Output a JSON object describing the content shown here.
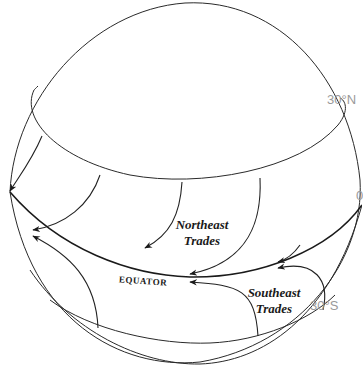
{
  "diagram": {
    "labels": {
      "lat_30n": "30°N",
      "lat_0": "0",
      "lat_30s": "30°S",
      "equator": "EQUATOR",
      "northeast_trades_line1": "Northeast",
      "northeast_trades_line2": "Trades",
      "southeast_trades_line1": "Southeast",
      "southeast_trades_line2": "Trades"
    },
    "colors": {
      "line": "#2a2a2a",
      "latitude_label": "#9a9a9a",
      "background": "#ffffff"
    }
  }
}
